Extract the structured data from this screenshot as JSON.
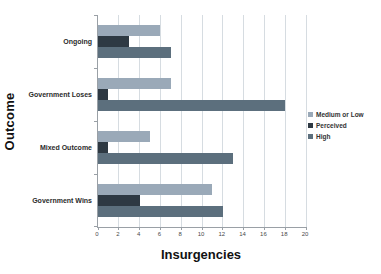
{
  "chart_data": {
    "type": "bar",
    "orientation": "horizontal",
    "xlabel": "Insurgencies",
    "ylabel": "Outcome",
    "categories": [
      "Ongoing",
      "Government Loses",
      "Mixed Outcome",
      "Government Wins"
    ],
    "series": [
      {
        "name": "Medium or Low",
        "color": "#9aa9b8",
        "values": [
          6,
          7,
          5,
          11
        ]
      },
      {
        "name": "Perceived",
        "color": "#2e3943",
        "values": [
          3,
          1,
          1,
          4
        ]
      },
      {
        "name": "High",
        "color": "#5c6f7d",
        "values": [
          7,
          18,
          13,
          12
        ]
      }
    ],
    "xlim": [
      0,
      20
    ],
    "xticks": [
      0,
      2,
      4,
      6,
      8,
      10,
      12,
      14,
      16,
      18,
      20
    ],
    "grid": true,
    "legend_position": "right",
    "background": "#ffffff",
    "gridline_color": "#d6dce1",
    "axis_color": "#9aa0a6"
  }
}
